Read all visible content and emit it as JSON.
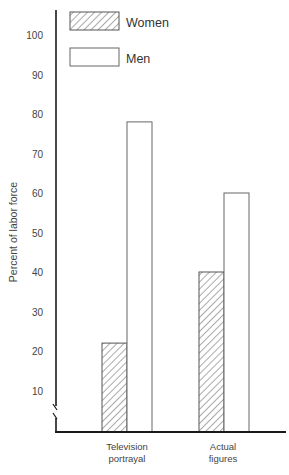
{
  "chart_data": {
    "type": "bar",
    "title": "",
    "xlabel": "",
    "ylabel": "Percent of labor force",
    "ylim": [
      0,
      100
    ],
    "yticks": [
      10,
      20,
      30,
      40,
      50,
      60,
      70,
      80,
      90,
      100
    ],
    "y_axis_break": true,
    "grid": false,
    "legend_position": "top-left",
    "categories": [
      "Television portrayal",
      "Actual figures"
    ],
    "category_lines": [
      [
        "Television",
        "portrayal"
      ],
      [
        "Actual",
        "figures"
      ]
    ],
    "series": [
      {
        "name": "Women",
        "values": [
          22,
          40
        ],
        "fill": "hatched"
      },
      {
        "name": "Men",
        "values": [
          78,
          60
        ],
        "fill": "white"
      }
    ]
  },
  "legend": {
    "items": [
      {
        "label": "Women",
        "pattern": "hatched"
      },
      {
        "label": "Men",
        "pattern": "white"
      }
    ]
  },
  "colors": {
    "axis": "#1a1a1a",
    "bar_outline": "#666666",
    "hatch": "#555555",
    "background": "#ffffff"
  }
}
